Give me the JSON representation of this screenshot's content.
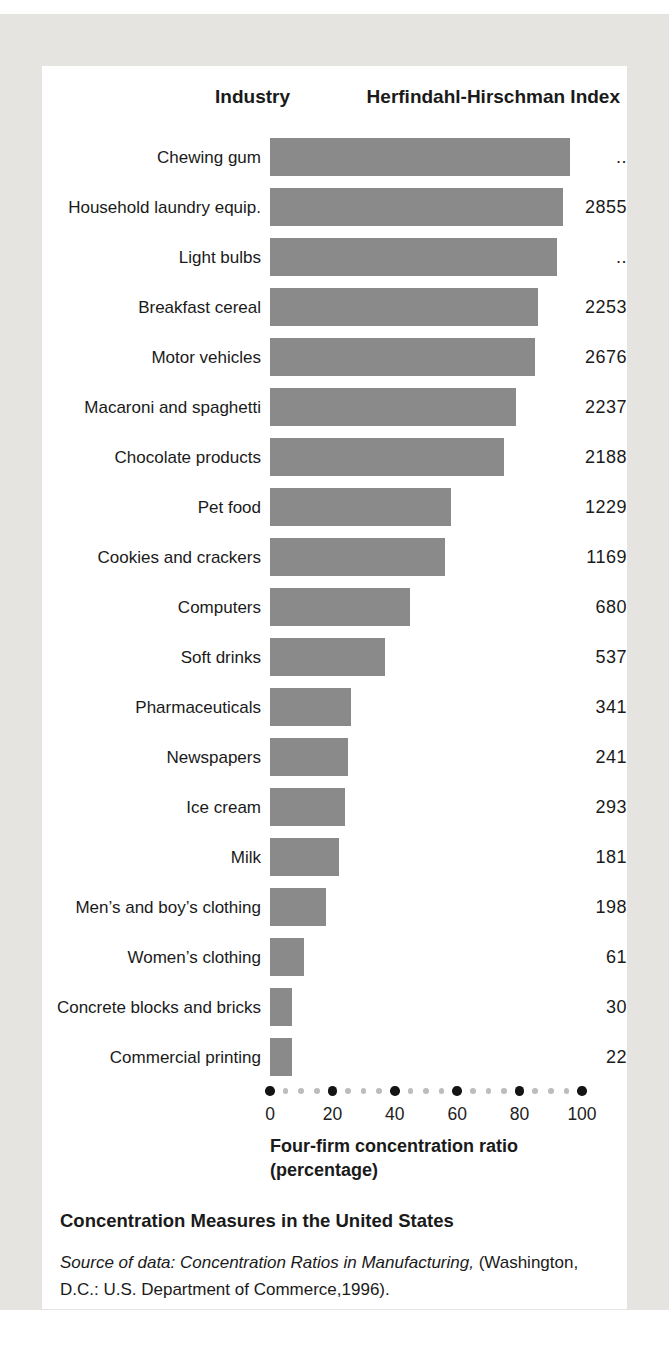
{
  "chart_data": {
    "type": "bar",
    "orientation": "horizontal",
    "title": "Concentration Measures in the United States",
    "col_headers": {
      "left": "Industry",
      "right": "Herfindahl-Hirschman Index"
    },
    "xlabel_line1": "Four-firm concentration ratio",
    "xlabel_line2": "(percentage)",
    "x_axis": {
      "min": 0,
      "max": 100,
      "major_ticks": [
        0,
        20,
        40,
        60,
        80,
        100
      ],
      "minor_step": 5,
      "style": "dotted-line"
    },
    "industries": [
      {
        "label": "Chewing gum",
        "cr4": 96,
        "hhi": ".."
      },
      {
        "label": "Household laundry equip.",
        "cr4": 94,
        "hhi": "2855"
      },
      {
        "label": "Light bulbs",
        "cr4": 92,
        "hhi": ".."
      },
      {
        "label": "Breakfast cereal",
        "cr4": 86,
        "hhi": "2253"
      },
      {
        "label": "Motor vehicles",
        "cr4": 85,
        "hhi": "2676"
      },
      {
        "label": "Macaroni and spaghetti",
        "cr4": 79,
        "hhi": "2237"
      },
      {
        "label": "Chocolate products",
        "cr4": 75,
        "hhi": "2188"
      },
      {
        "label": "Pet food",
        "cr4": 58,
        "hhi": "1229"
      },
      {
        "label": "Cookies and crackers",
        "cr4": 56,
        "hhi": "1169"
      },
      {
        "label": "Computers",
        "cr4": 45,
        "hhi": "680"
      },
      {
        "label": "Soft drinks",
        "cr4": 37,
        "hhi": "537"
      },
      {
        "label": "Pharmaceuticals",
        "cr4": 26,
        "hhi": "341"
      },
      {
        "label": "Newspapers",
        "cr4": 25,
        "hhi": "241"
      },
      {
        "label": "Ice cream",
        "cr4": 24,
        "hhi": "293"
      },
      {
        "label": "Milk",
        "cr4": 22,
        "hhi": "181"
      },
      {
        "label": "Men’s and boy’s clothing",
        "cr4": 18,
        "hhi": "198"
      },
      {
        "label": "Women’s clothing",
        "cr4": 11,
        "hhi": "61"
      },
      {
        "label": "Concrete blocks and bricks",
        "cr4": 7,
        "hhi": "30"
      },
      {
        "label": "Commercial printing",
        "cr4": 7,
        "hhi": "22"
      }
    ],
    "source": {
      "italic": "Source of data: Concentration Ratios in Manufacturing, ",
      "regular": "(Washington, D.C.: U.S. Department of Commerce,1996)."
    },
    "colors": {
      "bar": "#8a8a8a",
      "major_dot": "#141414",
      "minor_dot": "#bdbdbd",
      "page_bg": "#e6e4e0",
      "card_bg": "#ffffff",
      "text": "#1a1a1a"
    }
  }
}
